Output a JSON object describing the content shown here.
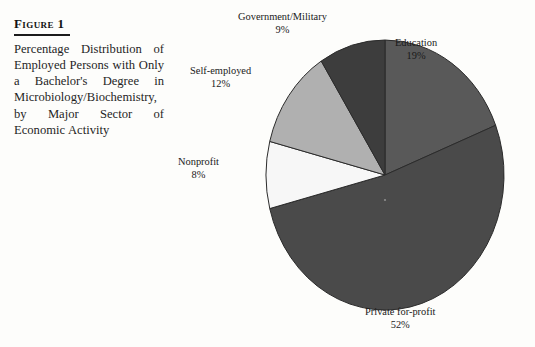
{
  "figure": {
    "title": "Figure 1",
    "caption": "Percentage Distribution of Employed Persons with Only a Bachelor's Degree in Microbiology/Biochemistry, by Major Sector of Economic Activity"
  },
  "labels": {
    "government": {
      "name": "Government/Military",
      "pct": "9%"
    },
    "education": {
      "name": "Education",
      "pct": "19%"
    },
    "selfemp": {
      "name": "Self-employed",
      "pct": "12%"
    },
    "nonprofit": {
      "name": "Nonprofit",
      "pct": "8%"
    },
    "private": {
      "name": "Private for-profit",
      "pct": "52%"
    }
  },
  "chart_data": {
    "type": "pie",
    "title": "Percentage Distribution of Employed Persons with Only a Bachelor's Degree in Microbiology/Biochemistry, by Major Sector of Economic Activity",
    "xlabel": "",
    "ylabel": "",
    "units": "percent",
    "total": 100,
    "start_angle_deg": 0,
    "direction": "clockwise",
    "legend": "none (direct wedge labels)",
    "grid": false,
    "categories": [
      "Education",
      "Private for-profit",
      "Nonprofit",
      "Self-employed",
      "Government/Military"
    ],
    "values": [
      19,
      52,
      8,
      12,
      9
    ],
    "slices": [
      {
        "label": "Education",
        "value": 19,
        "display": "19%",
        "color": "#595959",
        "start_deg": 0.0,
        "end_deg": 68.4
      },
      {
        "label": "Private for-profit",
        "value": 52,
        "display": "52%",
        "color": "#4a4a4a",
        "start_deg": 68.4,
        "end_deg": 255.6
      },
      {
        "label": "Nonprofit",
        "value": 8,
        "display": "8%",
        "color": "#f7f7f7",
        "start_deg": 255.6,
        "end_deg": 284.4
      },
      {
        "label": "Self-employed",
        "value": 12,
        "display": "12%",
        "color": "#b0b0b0",
        "start_deg": 284.4,
        "end_deg": 327.6
      },
      {
        "label": "Government/Military",
        "value": 9,
        "display": "9%",
        "color": "#3d3d3d",
        "start_deg": 327.6,
        "end_deg": 360.0
      }
    ]
  },
  "geometry": {
    "center_x": 215,
    "center_y": 175,
    "radius_x": 119,
    "radius_y": 135,
    "stroke": "#2b2b2b",
    "stroke_width": 1
  }
}
